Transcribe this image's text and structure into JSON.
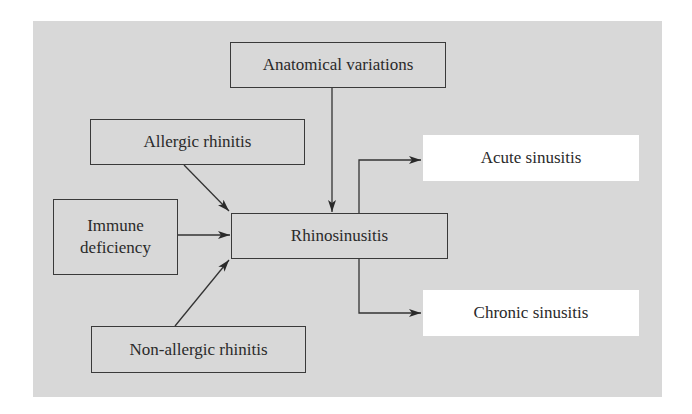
{
  "diagram": {
    "type": "flowchart",
    "background_color": "#d8d8d8",
    "nodes": {
      "anatomical": {
        "label": "Anatomical variations"
      },
      "allergic": {
        "label": "Allergic rhinitis"
      },
      "immune": {
        "label_line1": "Immune",
        "label_line2": "deficiency"
      },
      "rhinosinusitis": {
        "label": "Rhinosinusitis"
      },
      "nonallergic": {
        "label": "Non-allergic rhinitis"
      },
      "acute": {
        "label": "Acute sinusitis"
      },
      "chronic": {
        "label": "Chronic sinusitis"
      }
    },
    "edges": [
      {
        "from": "Anatomical variations",
        "to": "Rhinosinusitis"
      },
      {
        "from": "Allergic rhinitis",
        "to": "Rhinosinusitis"
      },
      {
        "from": "Immune deficiency",
        "to": "Rhinosinusitis"
      },
      {
        "from": "Non-allergic rhinitis",
        "to": "Rhinosinusitis"
      },
      {
        "from": "Rhinosinusitis",
        "to": "Acute sinusitis"
      },
      {
        "from": "Rhinosinusitis",
        "to": "Chronic sinusitis"
      }
    ]
  }
}
